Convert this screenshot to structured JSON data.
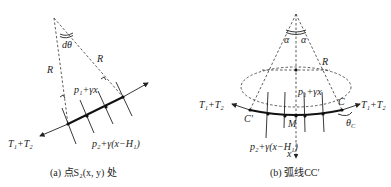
{
  "figure_a": {
    "caption": "(a) 点S₂(x, y) 处",
    "angle_label": "dθ",
    "radius_left": "R",
    "radius_right": "R",
    "inner_pressure": "p₁+γx",
    "outer_pressure": "p₂+γ(x−H₁)",
    "tension": "T₁+T₂"
  },
  "figure_b": {
    "caption": "(b) 弧线CC′",
    "angle_left": "α",
    "angle_right": "α",
    "radius": "R",
    "inner_pressure": "p₁+γx",
    "outer_pressure": "p₂+γ(x−H₁)",
    "tension_left": "T₁+T₂",
    "tension_right": "T₁+T₂",
    "point_c": "C",
    "point_c_prime": "C′",
    "point_m": "M",
    "contact_angle": "θ",
    "contact_angle_sub": "C",
    "axis": "x"
  }
}
